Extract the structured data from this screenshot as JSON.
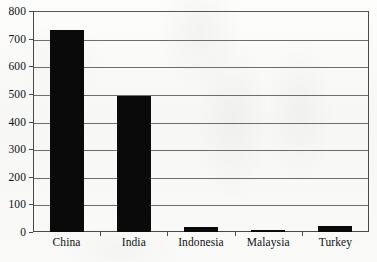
{
  "chart_data": {
    "type": "bar",
    "title": "",
    "subtitle": "",
    "xlabel": "",
    "ylabel": "",
    "categories": [
      "China",
      "India",
      "Indonesia",
      "Malaysia",
      "Turkey"
    ],
    "values": [
      730,
      492,
      17,
      7,
      22
    ],
    "series": [
      {
        "name": "",
        "values": [
          730,
          492,
          17,
          7,
          22
        ]
      }
    ],
    "ylim": [
      0,
      800
    ],
    "ytick_labels": [
      "0",
      "100",
      "200",
      "300",
      "400",
      "500",
      "600",
      "700",
      "800"
    ],
    "ytick_values": [
      0,
      100,
      200,
      300,
      400,
      500,
      600,
      700,
      800
    ],
    "ytick_step": 100,
    "grid": true,
    "grid_axis": "y",
    "legend": false,
    "legend_position": "none",
    "annotations": [],
    "bar_color": "#0a0a0a",
    "grid_color": "#6d6d6d",
    "axis_color": "#4a4a4a",
    "background_color": "#fbfbfa",
    "text_color": "#111111"
  }
}
